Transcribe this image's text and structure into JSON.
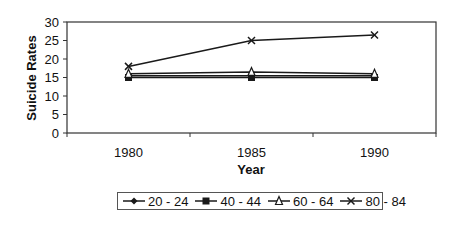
{
  "chart_data": {
    "type": "line",
    "title": "",
    "xlabel": "Year",
    "ylabel": "Suicide Rates",
    "categories": [
      "1980",
      "1985",
      "1990"
    ],
    "ylim": [
      0,
      30
    ],
    "yticks": [
      0,
      5,
      10,
      15,
      20,
      25,
      30
    ],
    "grid": false,
    "legend_position": "bottom",
    "series": [
      {
        "name": "20 - 24",
        "marker": "diamond",
        "values": [
          15.5,
          15.5,
          15.5
        ]
      },
      {
        "name": "40 - 44",
        "marker": "square",
        "values": [
          15,
          15,
          15
        ]
      },
      {
        "name": "60 - 64",
        "marker": "triangle",
        "values": [
          16,
          16.5,
          16
        ]
      },
      {
        "name": "80 - 84",
        "marker": "x",
        "values": [
          18,
          25,
          26.5
        ]
      }
    ]
  },
  "labels": {
    "xlabel": "Year",
    "ylabel": "Suicide Rates"
  },
  "colors": {
    "line": "#1a1a1a",
    "axis": "#333333"
  }
}
